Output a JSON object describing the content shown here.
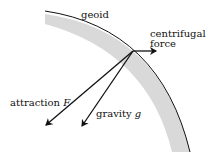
{
  "diagram": {
    "labels": {
      "geoid": "geoid",
      "centrifugal_line1": "centrifugal",
      "centrifugal_line2": "force",
      "attraction": "attraction",
      "attraction_symbol": "F",
      "gravity": "gravity",
      "gravity_symbol": "g"
    },
    "colors": {
      "line": "#111111",
      "band": "#d9d9d9"
    }
  }
}
